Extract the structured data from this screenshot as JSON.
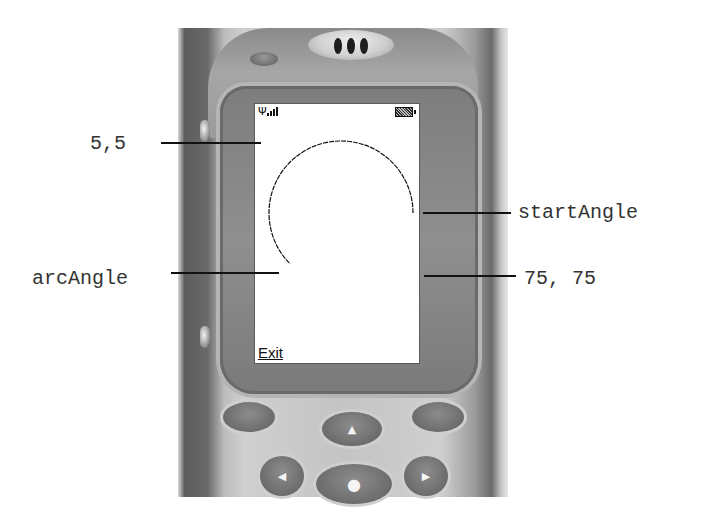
{
  "diagram": {
    "annotations": {
      "origin": "5,5",
      "start_angle": "startAngle",
      "arc_angle": "arcAngle",
      "size": "75, 75"
    },
    "arc": {
      "start_angle_deg": 0,
      "arc_angle_deg": 225,
      "stroke_color": "#111111"
    }
  },
  "phone": {
    "status_bar": {
      "antenna_icon": "Ψ",
      "signal_bars": 4,
      "battery_icon": "battery-full"
    },
    "softkeys": {
      "left": "Exit"
    },
    "keypad": {
      "up_glyph": "▲",
      "left_glyph": "◀",
      "right_glyph": "▶",
      "select_glyph": "●"
    },
    "colors": {
      "body": "#c4c4c4",
      "bezel": "#8a8a8a",
      "screen": "#ffffff",
      "keys": "#6c6c6c"
    }
  }
}
